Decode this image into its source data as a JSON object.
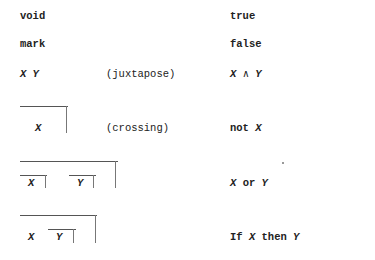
{
  "rows": [
    {
      "left": "void",
      "note": "",
      "right": "true"
    },
    {
      "left": "mark",
      "note": "",
      "right": "false"
    },
    {
      "left": "X Y",
      "note": "(juxtapose)",
      "right": "X ∧ Y"
    },
    {
      "left": "X",
      "note": "(crossing)",
      "right": "not X"
    },
    {
      "left_x": "X",
      "left_y": "Y",
      "note": "",
      "right": "X or Y"
    },
    {
      "left_x": "X",
      "left_y": "Y",
      "note": "",
      "right": "If X then Y"
    }
  ],
  "right_parts": {
    "and_x": "X",
    "and_op": "∧",
    "and_y": "Y",
    "not_word": "not",
    "not_x": "X",
    "or_x": "X",
    "or_word": "or",
    "or_y": "Y",
    "if_word": "If",
    "if_x": "X",
    "then_word": "then",
    "if_y": "Y"
  }
}
